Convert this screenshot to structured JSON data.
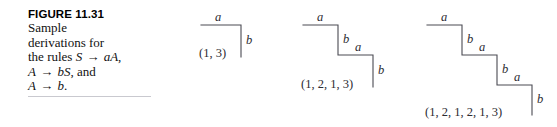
{
  "figure": {
    "title": "FIGURE 11.31",
    "caption_lines": [
      {
        "text": "Sample",
        "parts": [
          {
            "t": "Sample",
            "italic": false
          }
        ]
      },
      {
        "text": "derivations for",
        "parts": [
          {
            "t": "derivations for",
            "italic": false
          }
        ]
      },
      {
        "text": "the rules S → aA,",
        "parts": [
          {
            "t": "the rules ",
            "italic": false
          },
          {
            "t": "S",
            "italic": true
          },
          {
            "t": " → ",
            "italic": false
          },
          {
            "t": "aA",
            "italic": true
          },
          {
            "t": ",",
            "italic": false
          }
        ]
      },
      {
        "text": "A → bS, and",
        "parts": [
          {
            "t": "A",
            "italic": true
          },
          {
            "t": " → ",
            "italic": false
          },
          {
            "t": "bS",
            "italic": true
          },
          {
            "t": ", and",
            "italic": false
          }
        ]
      },
      {
        "text": "A → b.",
        "parts": [
          {
            "t": "A",
            "italic": true
          },
          {
            "t": " → ",
            "italic": false
          },
          {
            "t": "b",
            "italic": true
          },
          {
            "t": ".",
            "italic": false
          }
        ]
      }
    ],
    "rule_color": "#c9c9cf",
    "line_color": "#4a4a52",
    "text_color": "#2b2b31"
  },
  "diagrams": [
    {
      "id": "derivation-1",
      "steps": 1,
      "edge_labels": [
        "a",
        "b"
      ],
      "coordinate_label": "(1, 3)",
      "sequence": [
        1,
        3
      ]
    },
    {
      "id": "derivation-2",
      "steps": 2,
      "edge_labels": [
        "a",
        "b",
        "a",
        "b"
      ],
      "coordinate_label": "(1, 2, 1, 3)",
      "sequence": [
        1,
        2,
        1,
        3
      ]
    },
    {
      "id": "derivation-3",
      "steps": 3,
      "edge_labels": [
        "a",
        "b",
        "a",
        "b",
        "a",
        "b"
      ],
      "coordinate_label": "(1, 2, 1, 2, 1, 3)",
      "sequence": [
        1,
        2,
        1,
        2,
        1,
        3
      ]
    }
  ]
}
